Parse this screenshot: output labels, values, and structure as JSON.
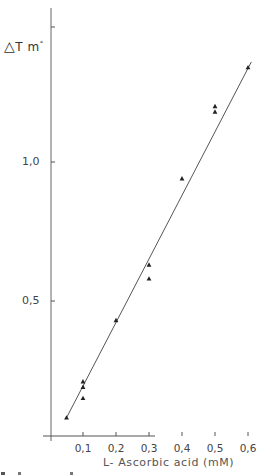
{
  "chart_data": {
    "type": "scatter",
    "title": "",
    "xlabel": "L-Ascorbic acid (mM)",
    "ylabel": "ΔT m°",
    "xlim": [
      0,
      0.65
    ],
    "ylim": [
      0,
      1.5
    ],
    "x_ticks": [
      "0,1",
      "0,2",
      "0,3",
      "0,4",
      "0,5",
      "0,6"
    ],
    "y_ticks": [
      "0,5",
      "1,0"
    ],
    "grid": false,
    "legend": null,
    "marker": "triangle",
    "series": [
      {
        "name": "measured",
        "points": [
          {
            "x": 0.05,
            "y": 0.08
          },
          {
            "x": 0.1,
            "y": 0.21
          },
          {
            "x": 0.1,
            "y": 0.19
          },
          {
            "x": 0.1,
            "y": 0.15
          },
          {
            "x": 0.2,
            "y": 0.43
          },
          {
            "x": 0.3,
            "y": 0.63
          },
          {
            "x": 0.3,
            "y": 0.58
          },
          {
            "x": 0.4,
            "y": 0.94
          },
          {
            "x": 0.5,
            "y": 1.2
          },
          {
            "x": 0.5,
            "y": 1.18
          },
          {
            "x": 0.6,
            "y": 1.34
          }
        ]
      }
    ],
    "fit_line": {
      "x": [
        0.05,
        0.61
      ],
      "y": [
        0.08,
        1.36
      ],
      "type": "linear"
    }
  },
  "labels": {
    "y_axis_symbol": "△",
    "y_axis_text": "T m",
    "y_axis_sup": "°",
    "x_axis": "L- Ascorbic acid (mM)",
    "y_ticks": [
      "1,0",
      "0,5"
    ],
    "x_ticks": [
      "0,1",
      "0,2",
      "0,3",
      "0,4",
      "0,5",
      "0,6"
    ]
  }
}
